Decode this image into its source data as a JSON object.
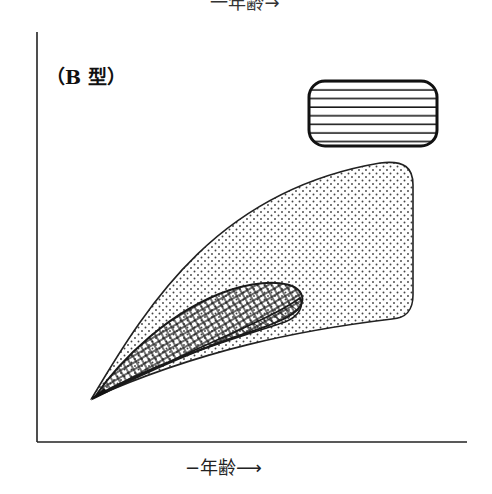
{
  "figure": {
    "top_clipped_label": "一年齢→",
    "panel_label": "（B 型）",
    "x_axis_label": "−年齢⟶",
    "colors": {
      "ink": "#1a1a1a",
      "background": "#ffffff",
      "dot_fill": "#555555"
    }
  },
  "legend": {
    "items": [
      {
        "name": "horizontal-line-pattern",
        "pattern": "horizontal-lines"
      }
    ]
  },
  "regions": [
    {
      "name": "dotted-region",
      "pattern": "dots",
      "description": "large wedge region widening with age"
    },
    {
      "name": "crosshatched-region",
      "pattern": "wavy-crosshatch",
      "description": "elongated oval within dotted region"
    },
    {
      "name": "diagonal-hatched-region",
      "pattern": "diagonal-lines",
      "description": "lower sliver below crosshatched oval"
    }
  ]
}
